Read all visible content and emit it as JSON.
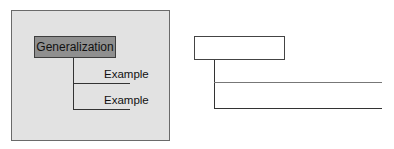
{
  "example_diagram": {
    "root_label": "Generalization",
    "children": [
      {
        "label": "Example"
      },
      {
        "label": "Example"
      }
    ],
    "background_color": "#e2e2e2",
    "root_fill": "#8f8f8f"
  },
  "template_diagram": {
    "root_label": "",
    "children": [
      {
        "label": ""
      },
      {
        "label": ""
      }
    ]
  }
}
